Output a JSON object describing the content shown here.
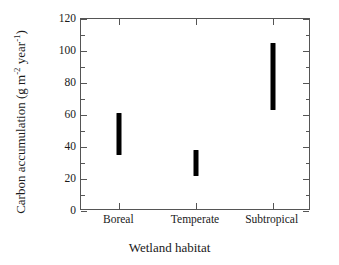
{
  "chart_data": {
    "type": "bar",
    "title": "",
    "subtitle": "",
    "xlabel": "Wetland habitat",
    "ylabel": "Carbon accumulation (g m⁻² year⁻¹)",
    "ylabel_parts": {
      "prefix": "Carbon accumulation (g m",
      "sup1": "-2",
      "middle": " year",
      "sup2": "-1",
      "suffix": ")"
    },
    "categories": [
      "Boreal",
      "Temperate",
      "Subtropical"
    ],
    "series": [
      {
        "name": "Carbon accumulation range",
        "type": "range",
        "values": [
          {
            "category": "Boreal",
            "low": 35,
            "high": 61
          },
          {
            "category": "Temperate",
            "low": 22,
            "high": 38
          },
          {
            "category": "Subtropical",
            "low": 63,
            "high": 105
          }
        ]
      }
    ],
    "ylim": [
      0,
      120
    ],
    "xlim_categories": 3,
    "y_major_ticks": [
      0,
      20,
      40,
      60,
      80,
      100,
      120
    ],
    "y_minor_ticks": [
      10,
      30,
      50,
      70,
      90,
      110
    ],
    "y_tick_labels": [
      "0",
      "20",
      "40",
      "60",
      "80",
      "100",
      "120"
    ],
    "grid": false,
    "legend": null,
    "legend_position": "none",
    "marker_color": "#000000",
    "axis_color": "#555555",
    "background_color": "#ffffff",
    "tick_direction": "in",
    "frame": "box"
  }
}
